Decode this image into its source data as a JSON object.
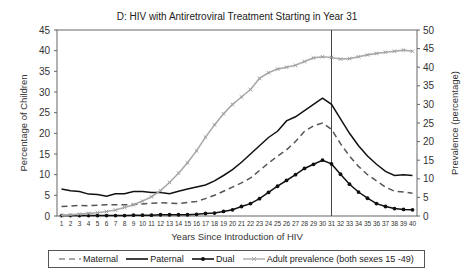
{
  "chart_data": {
    "type": "line",
    "title": "D: HIV with Antiretroviral Treatment Starting in Year 31",
    "xlabel": "Years Since Introduction of HIV",
    "ylabel": "Percentage of Children",
    "y2label": "Prevalence (percentage)",
    "ylim": [
      0,
      45
    ],
    "y2lim": [
      0,
      50
    ],
    "yticks": [
      0,
      5,
      10,
      15,
      20,
      25,
      30,
      35,
      40,
      45
    ],
    "y2ticks": [
      0,
      5,
      10,
      15,
      20,
      25,
      30,
      35,
      40,
      45,
      50
    ],
    "x": [
      1,
      2,
      3,
      4,
      5,
      6,
      7,
      8,
      9,
      10,
      11,
      12,
      13,
      14,
      15,
      16,
      17,
      18,
      19,
      20,
      21,
      22,
      23,
      24,
      25,
      26,
      27,
      28,
      29,
      30,
      31,
      32,
      33,
      34,
      35,
      36,
      37,
      38,
      39,
      40
    ],
    "vertical_marker_at": 31,
    "grid": false,
    "legend_position": "bottom",
    "series": [
      {
        "name": "Maternal",
        "axis": "left",
        "style": "dashed",
        "color": "#555555",
        "values": [
          2.3,
          2.4,
          2.6,
          2.5,
          2.6,
          2.7,
          2.7,
          2.7,
          2.8,
          2.9,
          3.1,
          3.2,
          3.1,
          3.0,
          3.3,
          3.5,
          4.2,
          5.0,
          6.0,
          7.0,
          8.0,
          9.2,
          11.0,
          12.8,
          14.5,
          16.0,
          18.0,
          20.5,
          21.8,
          22.5,
          21.0,
          17.5,
          14.5,
          12.0,
          10.0,
          8.5,
          7.0,
          6.0,
          5.8,
          5.5
        ]
      },
      {
        "name": "Paternal",
        "axis": "left",
        "style": "solid",
        "color": "#111111",
        "values": [
          6.5,
          6.1,
          5.9,
          5.3,
          5.2,
          4.8,
          5.4,
          5.4,
          5.9,
          5.9,
          5.7,
          5.7,
          5.4,
          6.0,
          6.5,
          7.0,
          7.5,
          8.5,
          9.8,
          11.2,
          13.0,
          15.0,
          17.0,
          19.0,
          20.5,
          23.0,
          24.0,
          25.5,
          27.0,
          28.5,
          27.0,
          23.5,
          20.0,
          17.0,
          14.5,
          12.5,
          10.8,
          9.8,
          10.0,
          9.8
        ]
      },
      {
        "name": "Dual",
        "axis": "left",
        "style": "solid-markers",
        "color": "#111111",
        "values": [
          0.1,
          0.1,
          0.1,
          0.1,
          0.1,
          0.1,
          0.1,
          0.1,
          0.2,
          0.2,
          0.2,
          0.3,
          0.3,
          0.3,
          0.3,
          0.4,
          0.6,
          0.7,
          1.1,
          1.5,
          2.3,
          3.0,
          4.2,
          5.7,
          7.2,
          8.6,
          10.0,
          11.5,
          12.5,
          13.5,
          12.6,
          10.1,
          7.7,
          5.8,
          4.3,
          3.0,
          2.3,
          1.8,
          1.6,
          1.5
        ]
      },
      {
        "name": "Adult prevalence (both sexes 15-49)",
        "axis": "right",
        "style": "solid-markers",
        "color": "#aaaaaa",
        "values": [
          0.2,
          0.3,
          0.5,
          0.7,
          0.9,
          1.2,
          1.6,
          2.3,
          3.0,
          4.0,
          5.2,
          6.8,
          9.0,
          11.5,
          14.3,
          17.5,
          21.2,
          24.5,
          27.5,
          30.0,
          32.0,
          34.0,
          37.0,
          38.5,
          39.5,
          40.0,
          40.5,
          41.5,
          42.5,
          42.8,
          42.6,
          42.2,
          42.3,
          42.8,
          43.3,
          43.7,
          44.0,
          44.3,
          44.6,
          44.3
        ]
      }
    ]
  },
  "legend": {
    "maternal": "Maternal",
    "paternal": "Paternal",
    "dual": "Dual",
    "adult": "Adult prevalence (both sexes 15 -49)"
  }
}
